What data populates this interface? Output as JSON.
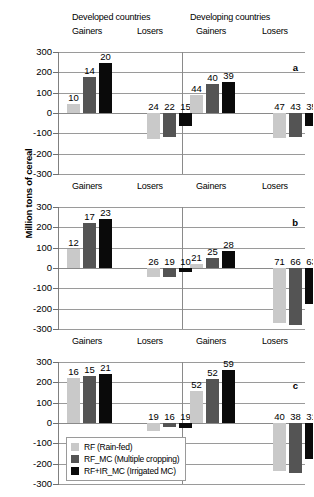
{
  "figure": {
    "y_axis_title": "Million tons of cereal",
    "group_headers": [
      "Developed countries",
      "Developing countries"
    ],
    "sub_headers": [
      "Gainers",
      "Losers",
      "Gainers",
      "Losers"
    ],
    "panel_letters": [
      "a",
      "b",
      "c"
    ],
    "y_ticks": [
      "300",
      "200",
      "100",
      "0",
      "-100",
      "-200",
      "-300"
    ],
    "colors": {
      "series_0": "#c9c9c9",
      "series_1": "#545454",
      "series_2": "#0a0a0a",
      "gridline": "#9a9a9a",
      "background": "#ffffff"
    }
  },
  "legend": {
    "items": [
      {
        "label": "RF (Rain-fed)",
        "color": "#c9c9c9"
      },
      {
        "label": "RF_MC (Multiple cropping)",
        "color": "#545454"
      },
      {
        "label": "RF+IR_MC (Irrigated MC)",
        "color": "#0a0a0a"
      }
    ]
  },
  "chart_data": {
    "type": "bar",
    "title": "",
    "xlabel": "",
    "ylabel": "Million tons of cereal",
    "ylim": [
      -300,
      300
    ],
    "ytick_step": 100,
    "grid": true,
    "legend_position": "inside-bottom-left",
    "series_names": [
      "RF (Rain-fed)",
      "RF_MC (Multiple cropping)",
      "RF+IR_MC (Irrigated MC)"
    ],
    "categories": [
      "Developed countries / Gainers",
      "Developed countries / Losers",
      "Developing countries / Gainers",
      "Developing countries / Losers"
    ],
    "panels": [
      {
        "letter": "a",
        "groups": [
          {
            "region": "Developed countries",
            "direction": "Gainers",
            "values": [
              45,
              178,
              245
            ],
            "labels": [
              "10",
              "14",
              "20"
            ]
          },
          {
            "region": "Developed countries",
            "direction": "Losers",
            "values": [
              -130,
              -118,
              -65
            ],
            "labels": [
              "24",
              "22",
              "15"
            ]
          },
          {
            "region": "Developing countries",
            "direction": "Gainers",
            "values": [
              90,
              142,
              152
            ],
            "labels": [
              "44",
              "40",
              "39"
            ]
          },
          {
            "region": "Developing countries",
            "direction": "Losers",
            "values": [
              -125,
              -118,
              -62
            ],
            "labels": [
              "47",
              "43",
              "35"
            ]
          }
        ]
      },
      {
        "letter": "b",
        "groups": [
          {
            "region": "Developed countries",
            "direction": "Gainers",
            "values": [
              95,
              222,
              242
            ],
            "labels": [
              "12",
              "17",
              "23"
            ]
          },
          {
            "region": "Developed countries",
            "direction": "Losers",
            "values": [
              -45,
              -42,
              -20
            ],
            "labels": [
              "26",
              "19",
              "10"
            ]
          },
          {
            "region": "Developing countries",
            "direction": "Gainers",
            "values": [
              22,
              50,
              85
            ],
            "labels": [
              "21",
              "25",
              "28"
            ]
          },
          {
            "region": "Developing countries",
            "direction": "Losers",
            "values": [
              -270,
              -282,
              -175
            ],
            "labels": [
              "71",
              "66",
              "63"
            ]
          }
        ]
      },
      {
        "letter": "c",
        "groups": [
          {
            "region": "Developed countries",
            "direction": "Gainers",
            "values": [
              220,
              230,
              243
            ],
            "labels": [
              "16",
              "15",
              "21"
            ]
          },
          {
            "region": "Developed countries",
            "direction": "Losers",
            "values": [
              -38,
              -22,
              -25
            ],
            "labels": [
              "19",
              "16",
              "19"
            ]
          },
          {
            "region": "Developing countries",
            "direction": "Gainers",
            "values": [
              155,
              215,
              260
            ],
            "labels": [
              "52",
              "52",
              "59"
            ]
          },
          {
            "region": "Developing countries",
            "direction": "Losers",
            "values": [
              -235,
              -245,
              -175
            ],
            "labels": [
              "40",
              "38",
              "31"
            ]
          }
        ]
      }
    ]
  }
}
